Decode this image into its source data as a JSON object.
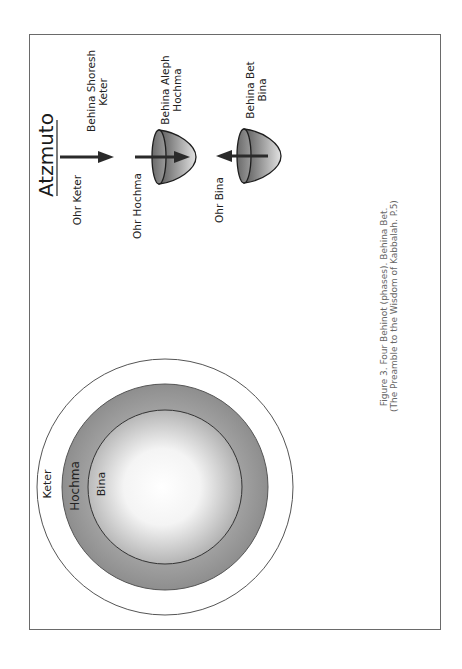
{
  "title": "Atzmuto",
  "stages": [
    {
      "light": "Ohr Keter",
      "phase_line1": "Behina Shoresh",
      "phase_line2": "Keter",
      "arrow": "right",
      "vessel": false
    },
    {
      "light": "Ohr Hochma",
      "phase_line1": "Behina Aleph",
      "phase_line2": "Hochma",
      "arrow": "right",
      "vessel": true
    },
    {
      "light": "Ohr Bina",
      "phase_line1": "Behina Bet",
      "phase_line2": "Bina",
      "arrow": "left",
      "vessel": true
    }
  ],
  "circles": {
    "outer": "Keter",
    "middle": "Hochma",
    "inner": "Bina"
  },
  "caption": {
    "line1": "Figure 3. Four Behinot (phases). Behina Bet.",
    "line2": "(The Preamble to the Wisdom of Kabbalah. P.5)"
  },
  "colors": {
    "frame": "#6a6a6a",
    "arrow": "#2a2a2a",
    "ring_dark": "#8a8a8a",
    "ring_light": "#ffffff"
  }
}
